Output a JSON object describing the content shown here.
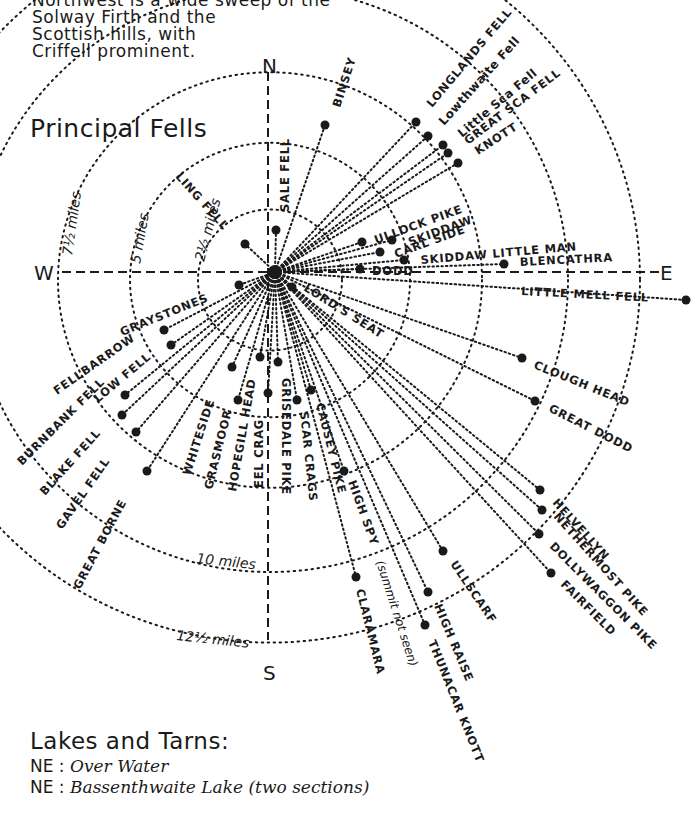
{
  "intro": {
    "lines": [
      "Northwest is a wide sweep of the",
      "Solway Firth and the",
      "Scottish hills, with",
      "Criffell prominent."
    ]
  },
  "heading": "Principal Fells",
  "compass": {
    "N": "N",
    "S": "S",
    "E": "E",
    "W": "W"
  },
  "rings": [
    {
      "label": "2½ miles",
      "r": 72
    },
    {
      "label": "5 miles",
      "r": 140
    },
    {
      "label": "7½ miles",
      "r": 212
    },
    {
      "label": "10 miles",
      "r": 298
    },
    {
      "label": "12½ miles",
      "r": 370
    }
  ],
  "center": {
    "x": 275,
    "y": 272
  },
  "fells": [
    {
      "name": "BINSEY",
      "x": 325,
      "y": 125
    },
    {
      "name": "LONGLANDS FELL",
      "x": 416,
      "y": 122
    },
    {
      "name": "Lowthwaite Fell",
      "x": 428,
      "y": 136
    },
    {
      "name": "Little Sca Fell",
      "x": 443,
      "y": 145
    },
    {
      "name": "GREAT SCA FELL",
      "x": 448,
      "y": 153
    },
    {
      "name": "KNOTT",
      "x": 458,
      "y": 163
    },
    {
      "name": "SALE FELL",
      "x": 276,
      "y": 230
    },
    {
      "name": "LING FELL",
      "x": 245,
      "y": 244
    },
    {
      "name": "ULLOCK PIKE",
      "x": 362,
      "y": 242
    },
    {
      "name": "SKIDDAW",
      "x": 392,
      "y": 240
    },
    {
      "name": "CARL SIDE",
      "x": 380,
      "y": 252
    },
    {
      "name": "SKIDDAW LITTLE MAN",
      "x": 404,
      "y": 260
    },
    {
      "name": "DODD",
      "x": 360,
      "y": 269
    },
    {
      "name": "BLENCATHRA",
      "x": 504,
      "y": 264
    },
    {
      "name": "LITTLE MELL FELL",
      "x": 686,
      "y": 300
    },
    {
      "name": "LORD'S SEAT",
      "x": 292,
      "y": 287
    },
    {
      "name": "GRAYSTONES",
      "x": 239,
      "y": 285
    },
    {
      "name": "CLOUGH HEAD",
      "x": 522,
      "y": 358
    },
    {
      "name": "GREAT DODD",
      "x": 535,
      "y": 401
    },
    {
      "name": "FELLBARROW",
      "x": 164,
      "y": 330
    },
    {
      "name": "LOW FELL",
      "x": 171,
      "y": 345
    },
    {
      "name": "BURNBANK FELL",
      "x": 125,
      "y": 395
    },
    {
      "name": "BLAKE FELL",
      "x": 122,
      "y": 415
    },
    {
      "name": "GAVEL FELL",
      "x": 136,
      "y": 432
    },
    {
      "name": "GREAT BORNE",
      "x": 147,
      "y": 471
    },
    {
      "name": "WHITESIDE",
      "x": 232,
      "y": 367
    },
    {
      "name": "GRASMOOR",
      "x": 238,
      "y": 400
    },
    {
      "name": "HOPEGILL HEAD",
      "x": 260,
      "y": 357
    },
    {
      "name": "EEL CRAG",
      "x": 268,
      "y": 393
    },
    {
      "name": "GRISEDALE PIKE",
      "x": 278,
      "y": 362
    },
    {
      "name": "SCAR CRAGS",
      "x": 297,
      "y": 400
    },
    {
      "name": "CAUSEY PIKE",
      "x": 311,
      "y": 390
    },
    {
      "name": "HIGH SPY",
      "note": "(summit not seen)",
      "x": 344,
      "y": 471
    },
    {
      "name": "CLARAMARA",
      "x": 356,
      "y": 577
    },
    {
      "name": "ULLSCARF",
      "x": 443,
      "y": 551
    },
    {
      "name": "HIGH RAISE",
      "x": 428,
      "y": 592
    },
    {
      "name": "THUNACAR KNOTT",
      "x": 425,
      "y": 625
    },
    {
      "name": "HELVELLYN",
      "x": 540,
      "y": 490
    },
    {
      "name": "NETHERMOST PIKE",
      "x": 542,
      "y": 510
    },
    {
      "name": "DOLLYWAGGON PIKE",
      "x": 539,
      "y": 534
    },
    {
      "name": "FAIRFIELD",
      "x": 551,
      "y": 573
    }
  ],
  "lakes": {
    "title": "Lakes and Tarns:",
    "items": [
      {
        "dir": "NE",
        "name": "Over Water"
      },
      {
        "dir": "NE",
        "name": "Bassenthwaite Lake (two sections)"
      }
    ]
  }
}
